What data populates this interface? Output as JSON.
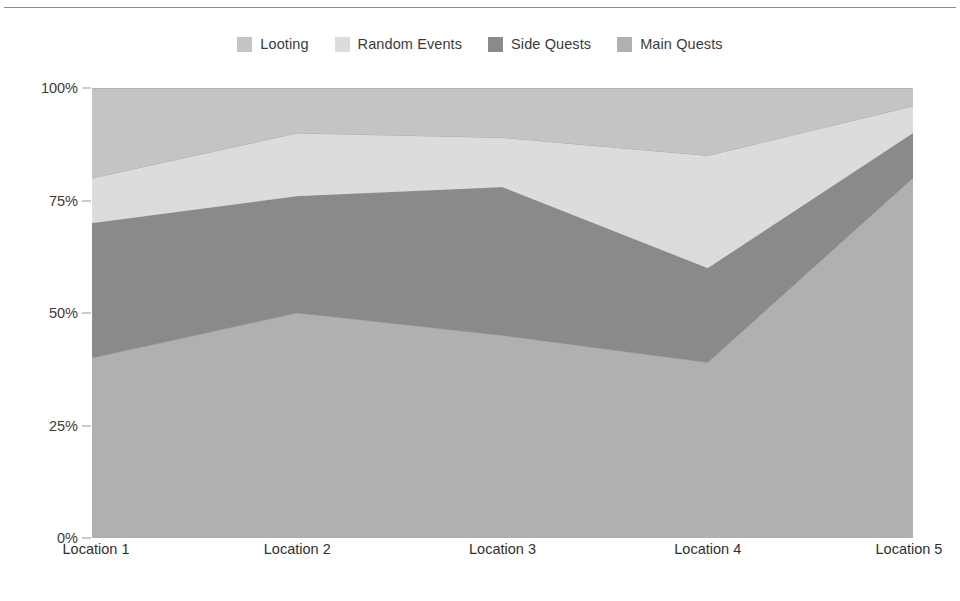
{
  "chart_data": {
    "type": "area",
    "stacked": true,
    "title": "",
    "subtitle": "",
    "xlabel": "",
    "ylabel": "",
    "categories": [
      "Location 1",
      "Location 2",
      "Location 3",
      "Location 4",
      "Location 5"
    ],
    "x": [
      0,
      1,
      2,
      3,
      4
    ],
    "ylim": [
      0,
      100
    ],
    "ytick_labels": [
      "0%",
      "25%",
      "50%",
      "75%",
      "100%"
    ],
    "ytick_values": [
      0,
      25,
      50,
      75,
      100
    ],
    "y_unit": "%",
    "grid": true,
    "grid_axis": "y",
    "legend_position": "top-center",
    "series": [
      {
        "name": "Main Quests",
        "color": "#b0b0b0",
        "stack_order": 1,
        "values": [
          40,
          50,
          45,
          39,
          80
        ],
        "cumulative": [
          40,
          50,
          45,
          39,
          80
        ]
      },
      {
        "name": "Side Quests",
        "color": "#8a8a8a",
        "stack_order": 2,
        "values": [
          30,
          26,
          33,
          21,
          10
        ],
        "cumulative": [
          70,
          76,
          78,
          60,
          90
        ]
      },
      {
        "name": "Random Events",
        "color": "#dcdcdc",
        "stack_order": 3,
        "values": [
          10,
          14,
          11,
          25,
          6
        ],
        "cumulative": [
          80,
          90,
          89,
          85,
          96
        ]
      },
      {
        "name": "Looting",
        "color": "#c4c4c4",
        "stack_order": 4,
        "values": [
          20,
          10,
          11,
          15,
          4
        ],
        "cumulative": [
          100,
          100,
          100,
          100,
          100
        ]
      }
    ],
    "legend_entries": [
      {
        "label": "Looting",
        "color": "#c4c4c4"
      },
      {
        "label": "Random Events",
        "color": "#dcdcdc"
      },
      {
        "label": "Side Quests",
        "color": "#8a8a8a"
      },
      {
        "label": "Main Quests",
        "color": "#b0b0b0"
      }
    ]
  },
  "colors": {
    "background": "#ffffff",
    "axis_text": "#3b3b3b",
    "gridline": "#e8e8e8",
    "baseline": "#9a9a9a",
    "top_rule": "#8d8d8d",
    "band_stroke": "#9d9d9d"
  }
}
